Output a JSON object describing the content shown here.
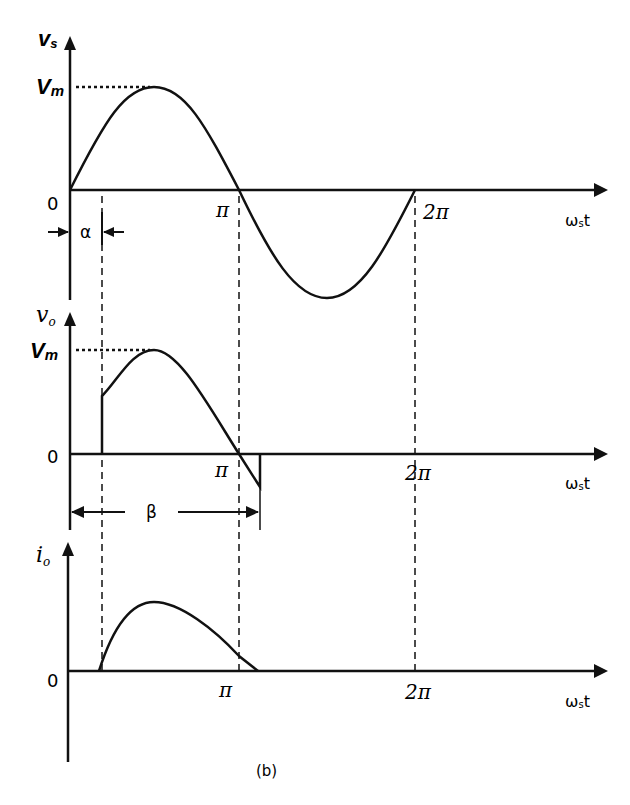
{
  "figure": {
    "caption": "(b)",
    "x_axis_label": "ωst",
    "panels": [
      {
        "id": "source-voltage",
        "y_label": "vs",
        "y_label_main": "v",
        "y_label_sub": "s",
        "peak_label": "Vm",
        "peak_label_main": "V",
        "peak_label_sub": "m",
        "origin_label": "0",
        "tick_labels": [
          "π",
          "2π"
        ],
        "angle_label": "α",
        "x_label_main": "ω",
        "x_label_sub": "s",
        "x_label_end": "t"
      },
      {
        "id": "output-voltage",
        "y_label_main": "v",
        "y_label_sub": "o",
        "peak_label_main": "V",
        "peak_label_sub": "m",
        "origin_label": "0",
        "tick_labels": [
          "π",
          "2π"
        ],
        "angle_label": "β",
        "x_label_main": "ω",
        "x_label_sub": "s",
        "x_label_end": "t"
      },
      {
        "id": "output-current",
        "y_label_main": "i",
        "y_label_sub": "o",
        "origin_label": "0",
        "tick_labels": [
          "π",
          "2π"
        ],
        "x_label_main": "ω",
        "x_label_sub": "s",
        "x_label_end": "t"
      }
    ]
  }
}
